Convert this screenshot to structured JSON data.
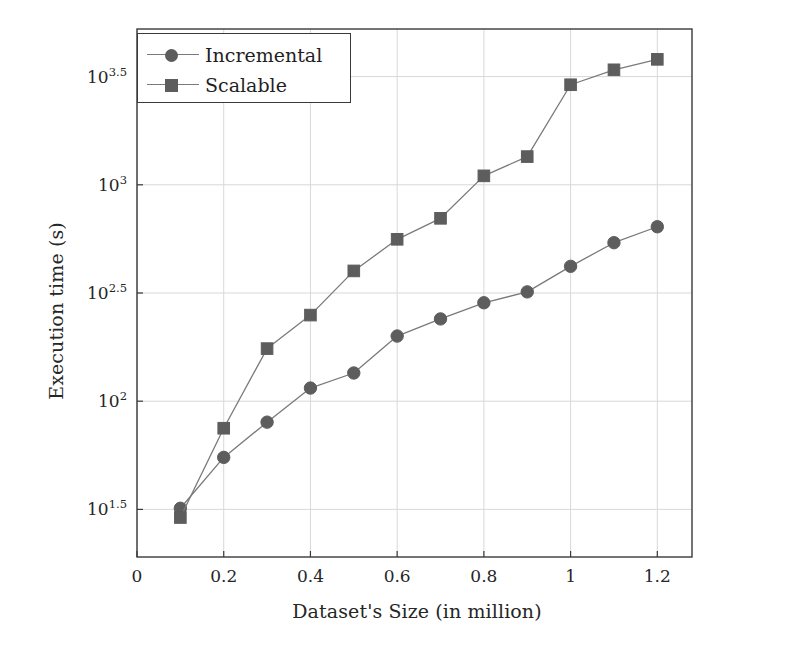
{
  "chart_data": {
    "type": "line",
    "title": "",
    "xlabel": "Dataset's Size (in million)",
    "ylabel": "Execution time (s)",
    "x": [
      0.1,
      0.2,
      0.3,
      0.4,
      0.5,
      0.6,
      0.7,
      0.8,
      0.9,
      1.0,
      1.1,
      1.2
    ],
    "xlim": [
      0,
      1.28
    ],
    "ylim_log10": [
      1.28,
      3.72
    ],
    "yscale": "log",
    "grid": true,
    "legend_position": "top-left",
    "xticks": [
      "0",
      "0.2",
      "0.4",
      "0.6",
      "0.8",
      "1",
      "1.2"
    ],
    "xtick_values": [
      0,
      0.2,
      0.4,
      0.6,
      0.8,
      1.0,
      1.2
    ],
    "ytick_labels": [
      "10",
      "10",
      "10",
      "10",
      "10"
    ],
    "ytick_exponents": [
      "1.5",
      "2",
      "2.5",
      "3",
      "3.5"
    ],
    "ytick_log10": [
      1.5,
      2.0,
      2.5,
      3.0,
      3.5
    ],
    "series": [
      {
        "name": "Incremental",
        "marker": "circle",
        "color": "#5d5d5d",
        "values": [
          32,
          55,
          80,
          115,
          135,
          200,
          240,
          285,
          320,
          420,
          540,
          640
        ]
      },
      {
        "name": "Scalable",
        "marker": "square",
        "color": "#5d5d5d",
        "values": [
          29,
          75,
          175,
          250,
          400,
          560,
          700,
          1100,
          1350,
          2900,
          3400,
          3800
        ]
      }
    ]
  },
  "legend": {
    "items": [
      {
        "label": "Incremental",
        "marker": "circle"
      },
      {
        "label": "Scalable",
        "marker": "square"
      }
    ]
  },
  "colors": {
    "line": "#7a7a7a",
    "marker": "#5d5d5d",
    "grid": "#d8d8d8",
    "axis": "#3a3a3a",
    "text": "#262626"
  }
}
